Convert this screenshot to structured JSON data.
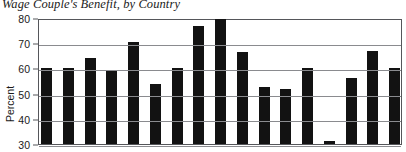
{
  "chart_data": {
    "type": "bar",
    "title": "Wage Couple's Benefit, by Country",
    "xlabel": "",
    "ylabel": "Percent",
    "ylim": [
      30,
      80
    ],
    "ytick_labels": [
      "80",
      "70",
      "60",
      "50",
      "40",
      "30"
    ],
    "ytick_values": [
      80,
      70,
      60,
      50,
      40,
      30
    ],
    "grid": true,
    "legend": "none",
    "bar_color": "#121212",
    "categories": [
      "",
      "",
      "",
      "",
      "",
      "",
      "",
      "",
      "",
      "",
      "",
      "",
      "",
      "",
      "",
      "",
      ""
    ],
    "values": [
      60,
      60,
      64,
      59,
      70.5,
      54,
      60,
      77,
      79.5,
      66.5,
      52.5,
      52,
      60,
      31,
      56,
      67,
      60
    ]
  },
  "figure": {
    "title": "Wage Couple's Benefit, by Country",
    "y_axis_title": "Percent",
    "axis_color": "#55565a",
    "grid_color": "#8a8b8f",
    "background": "#ffffff"
  }
}
